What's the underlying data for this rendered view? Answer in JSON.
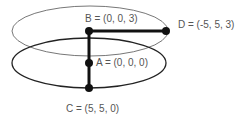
{
  "diagram": {
    "ellipses": [
      {
        "name": "upper-plane",
        "cx": 90,
        "cy": 31,
        "rx": 78,
        "ry": 25,
        "stroke": "#777777",
        "stroke_width": 1
      },
      {
        "name": "lower-plane",
        "cx": 89,
        "cy": 63,
        "rx": 77,
        "ry": 25,
        "stroke": "#222222",
        "stroke_width": 1.3
      }
    ],
    "points": [
      {
        "id": "A",
        "label": "A = (0, 0, 0)",
        "x": 89,
        "y": 63
      },
      {
        "id": "B",
        "label": "B = (0, 0, 3)",
        "x": 89,
        "y": 31
      },
      {
        "id": "C",
        "label": "C = (5, 5, 0)",
        "x": 89,
        "y": 88
      },
      {
        "id": "D",
        "label": "D = (-5, 5, 3)",
        "x": 166,
        "y": 31
      }
    ],
    "segments": [
      {
        "from": "B",
        "to": "C"
      },
      {
        "from": "B",
        "to": "D"
      }
    ]
  }
}
